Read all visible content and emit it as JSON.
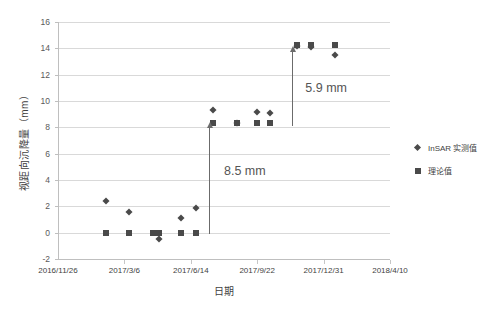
{
  "chart_data": {
    "type": "scatter",
    "title": "",
    "xlabel": "日期",
    "ylabel": "视距向沉降量（mm）",
    "ylim": [
      -2,
      16
    ],
    "ytick_step": 2,
    "yticks": [
      "16",
      "14",
      "12",
      "10",
      "8",
      "6",
      "4",
      "2",
      "0",
      "-2"
    ],
    "xticks": [
      "2016/11/26",
      "2017/3/6",
      "2017/6/14",
      "2017/9/22",
      "2017/12/31",
      "2018/4/10"
    ],
    "grid": true,
    "legend_position": "right",
    "series": [
      {
        "name": "InSAR 实测值",
        "marker": "diamond",
        "color": "#4a4a4a",
        "points": [
          {
            "x": 0.145,
            "y": 2.4
          },
          {
            "x": 0.215,
            "y": 1.6
          },
          {
            "x": 0.305,
            "y": -0.5
          },
          {
            "x": 0.37,
            "y": 1.1
          },
          {
            "x": 0.415,
            "y": 1.9
          },
          {
            "x": 0.468,
            "y": 9.3
          },
          {
            "x": 0.54,
            "y": 8.3
          },
          {
            "x": 0.598,
            "y": 9.2
          },
          {
            "x": 0.64,
            "y": 9.1
          },
          {
            "x": 0.72,
            "y": 14.2
          },
          {
            "x": 0.762,
            "y": 14.1
          },
          {
            "x": 0.835,
            "y": 13.5
          }
        ]
      },
      {
        "name": "理论值",
        "marker": "square",
        "color": "#4a4a4a",
        "points": [
          {
            "x": 0.145,
            "y": 0.0
          },
          {
            "x": 0.215,
            "y": 0.0
          },
          {
            "x": 0.285,
            "y": 0.0
          },
          {
            "x": 0.305,
            "y": 0.0
          },
          {
            "x": 0.37,
            "y": 0.0
          },
          {
            "x": 0.415,
            "y": 0.0
          },
          {
            "x": 0.468,
            "y": 8.35
          },
          {
            "x": 0.54,
            "y": 8.3
          },
          {
            "x": 0.598,
            "y": 8.35
          },
          {
            "x": 0.64,
            "y": 8.35
          },
          {
            "x": 0.72,
            "y": 14.25
          },
          {
            "x": 0.762,
            "y": 14.25
          },
          {
            "x": 0.835,
            "y": 14.25
          }
        ]
      }
    ],
    "annotations": [
      {
        "label": "8.5 mm",
        "x": 0.455,
        "y_from": -0.1,
        "y_to": 8.4,
        "text_x": 0.5,
        "text_y": 4.6
      },
      {
        "label": "5.9 mm",
        "x": 0.705,
        "y_from": 8.1,
        "y_to": 14.2,
        "text_x": 0.745,
        "text_y": 10.9
      }
    ]
  },
  "legend": {
    "items": [
      {
        "label": "InSAR 实测值",
        "marker": "diamond"
      },
      {
        "label": "理论值",
        "marker": "square"
      }
    ]
  }
}
